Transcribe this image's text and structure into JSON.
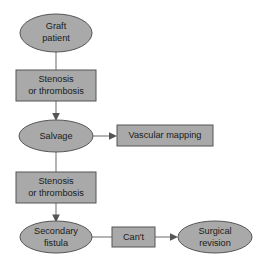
{
  "diagram": {
    "type": "flowchart",
    "title": "",
    "background_color": "#ffffff",
    "shape_fill_color": "#a9a9a9",
    "shape_stroke_color": "#555555",
    "connector_color": "#777777",
    "text_color": "#1a1a1a",
    "nodes": [
      {
        "id": "graft-patient",
        "shape": "ellipse",
        "line1": "Graft",
        "line2": "patient"
      },
      {
        "id": "stenosis-thrombosis-1",
        "shape": "rectangle",
        "line1": "Stenosis",
        "line2": "or thrombosis"
      },
      {
        "id": "salvage",
        "shape": "ellipse",
        "line1": "Salvage",
        "line2": ""
      },
      {
        "id": "vascular-mapping",
        "shape": "rectangle",
        "line1": "Vascular mapping",
        "line2": ""
      },
      {
        "id": "stenosis-thrombosis-2",
        "shape": "rectangle",
        "line1": "Stenosis",
        "line2": "or thrombosis"
      },
      {
        "id": "secondary-fistula",
        "shape": "ellipse",
        "line1": "Secondary",
        "line2": "fistula"
      },
      {
        "id": "cant",
        "shape": "rectangle",
        "line1": "Can't",
        "line2": ""
      },
      {
        "id": "surgical-revision",
        "shape": "ellipse",
        "line1": "Surgical",
        "line2": "revision"
      }
    ],
    "edges": [
      {
        "id": "edge-graft-to-stenosis1",
        "from": "graft-patient",
        "to": "stenosis-thrombosis-1",
        "label": "",
        "arrow": false
      },
      {
        "id": "edge-stenosis1-to-salvage",
        "from": "stenosis-thrombosis-1",
        "to": "salvage",
        "label": "",
        "arrow": true
      },
      {
        "id": "edge-salvage-to-vascular",
        "from": "salvage",
        "to": "vascular-mapping",
        "label": "",
        "arrow": true
      },
      {
        "id": "edge-salvage-to-stenosis2",
        "from": "salvage",
        "to": "stenosis-thrombosis-2",
        "label": "",
        "arrow": false
      },
      {
        "id": "edge-stenosis2-to-fistula",
        "from": "stenosis-thrombosis-2",
        "to": "secondary-fistula",
        "label": "",
        "arrow": true
      },
      {
        "id": "edge-fistula-to-cant",
        "from": "secondary-fistula",
        "to": "cant",
        "label": "",
        "arrow": false
      },
      {
        "id": "edge-cant-to-surgical",
        "from": "cant",
        "to": "surgical-revision",
        "label": "",
        "arrow": true
      }
    ]
  }
}
